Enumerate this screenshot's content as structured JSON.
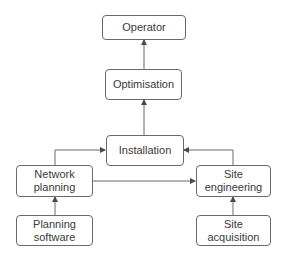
{
  "diagram": {
    "type": "flowchart",
    "colors": {
      "stroke": "#6a6a6a",
      "text": "#3a3a3a",
      "background": "#ffffff"
    },
    "nodes": {
      "operator": {
        "label": "Operator"
      },
      "optimisation": {
        "label": "Optimisation"
      },
      "installation": {
        "label": "Installation"
      },
      "network_planning": {
        "label": "Network\nplanning"
      },
      "site_engineering": {
        "label": "Site\nengineering"
      },
      "planning_software": {
        "label": "Planning\nsoftware"
      },
      "site_acquisition": {
        "label": "Site\nacquisition"
      }
    },
    "edges": [
      {
        "from": "optimisation",
        "to": "operator"
      },
      {
        "from": "installation",
        "to": "optimisation"
      },
      {
        "from": "network_planning",
        "to": "installation"
      },
      {
        "from": "site_engineering",
        "to": "installation"
      },
      {
        "from": "network_planning",
        "to": "site_engineering"
      },
      {
        "from": "planning_software",
        "to": "network_planning"
      },
      {
        "from": "site_acquisition",
        "to": "site_engineering"
      }
    ]
  }
}
